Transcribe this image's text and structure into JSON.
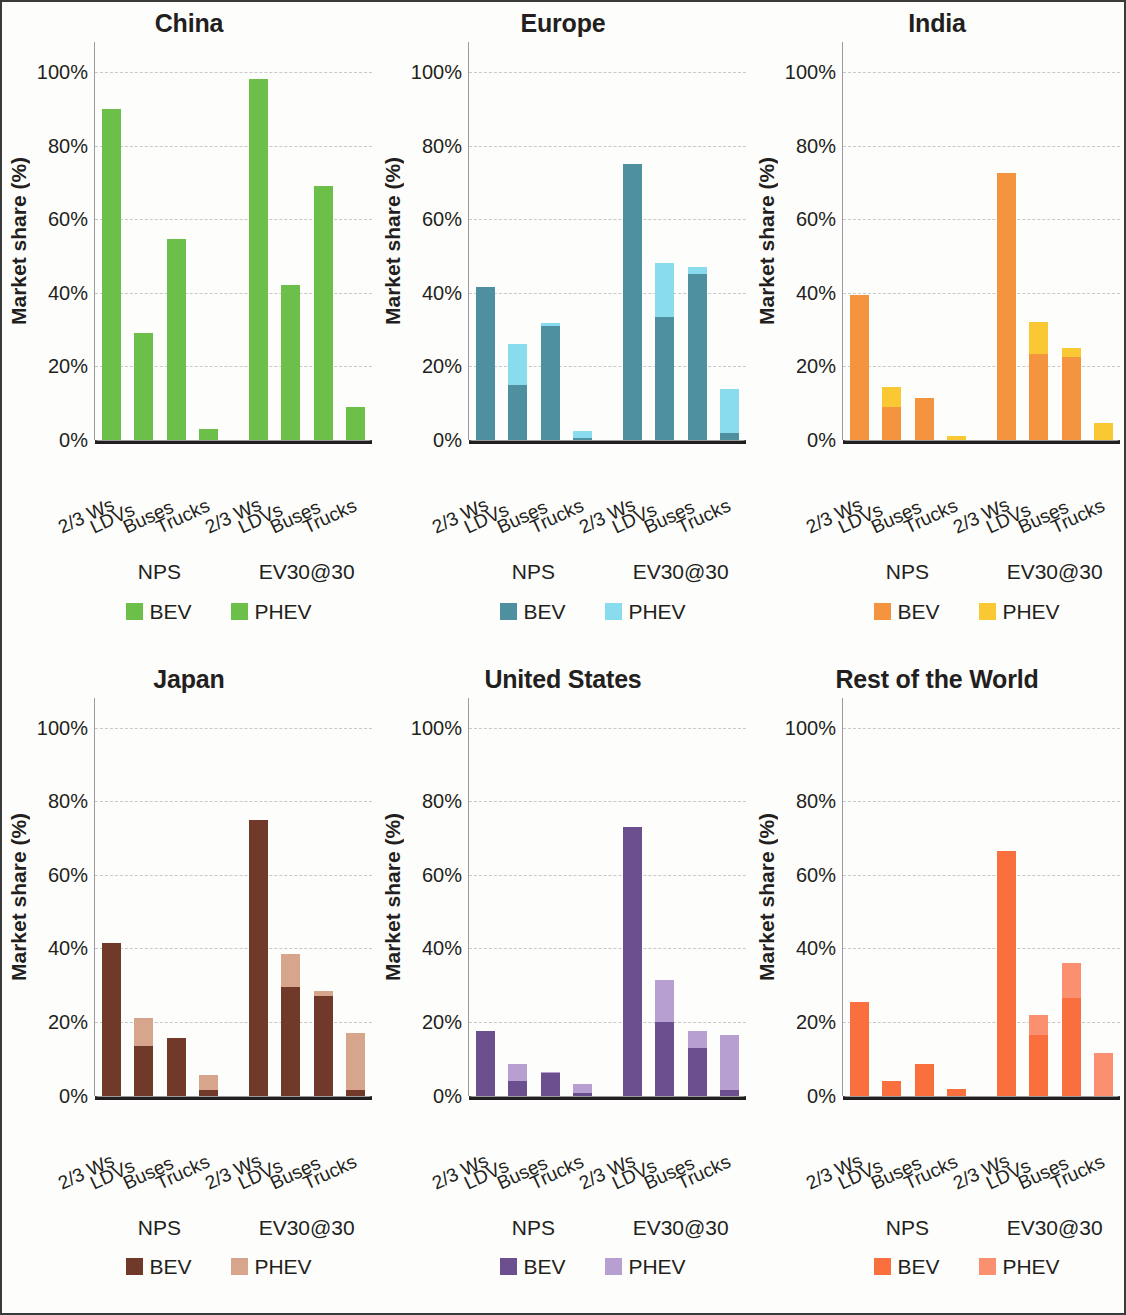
{
  "figure": {
    "ylabel": "Market share (%)",
    "yticks": [
      "0%",
      "20%",
      "40%",
      "60%",
      "80%",
      "100%"
    ],
    "ytick_values": [
      0,
      20,
      40,
      60,
      80,
      100
    ],
    "categories": [
      "2/3 Ws",
      "LDVs",
      "Buses",
      "Trucks"
    ],
    "scenarios": [
      "NPS",
      "EV30@30"
    ],
    "legend": [
      "BEV",
      "PHEV"
    ]
  },
  "chart_data": [
    {
      "type": "bar",
      "title": "China",
      "xlabel": "",
      "ylabel": "Market share (%)",
      "ylim": [
        0,
        100
      ],
      "grid": true,
      "legend_position": "bottom",
      "stacked": true,
      "categories": [
        "2/3 Ws",
        "LDVs",
        "Buses",
        "Trucks"
      ],
      "scenarios": [
        "NPS",
        "EV30@30"
      ],
      "colors": {
        "BEV": "#6cc04a",
        "PHEV": "#6cc04a"
      },
      "groups": [
        {
          "scenario": "NPS",
          "series": [
            {
              "name": "BEV",
              "values": [
                90,
                29,
                54.5,
                3
              ]
            },
            {
              "name": "PHEV",
              "values": [
                0,
                0,
                0,
                0
              ]
            }
          ]
        },
        {
          "scenario": "EV30@30",
          "series": [
            {
              "name": "BEV",
              "values": [
                98,
                42,
                69,
                9
              ]
            },
            {
              "name": "PHEV",
              "values": [
                0,
                0,
                0,
                0
              ]
            }
          ]
        }
      ]
    },
    {
      "type": "bar",
      "title": "Europe",
      "xlabel": "",
      "ylabel": "Market share (%)",
      "ylim": [
        0,
        100
      ],
      "grid": true,
      "legend_position": "bottom",
      "stacked": true,
      "categories": [
        "2/3 Ws",
        "LDVs",
        "Buses",
        "Trucks"
      ],
      "scenarios": [
        "NPS",
        "EV30@30"
      ],
      "colors": {
        "BEV": "#4e8fa0",
        "PHEV": "#88dcee"
      },
      "groups": [
        {
          "scenario": "NPS",
          "series": [
            {
              "name": "BEV",
              "values": [
                41.5,
                15,
                31,
                0.6
              ]
            },
            {
              "name": "PHEV",
              "values": [
                0,
                11,
                0.8,
                1.8
              ]
            }
          ]
        },
        {
          "scenario": "EV30@30",
          "series": [
            {
              "name": "BEV",
              "values": [
                75,
                33.5,
                45,
                1.8
              ]
            },
            {
              "name": "PHEV",
              "values": [
                0,
                14.5,
                2,
                12.2
              ]
            }
          ]
        }
      ]
    },
    {
      "type": "bar",
      "title": "India",
      "xlabel": "",
      "ylabel": "Market share (%)",
      "ylim": [
        0,
        100
      ],
      "grid": true,
      "legend_position": "bottom",
      "stacked": true,
      "categories": [
        "2/3 Ws",
        "LDVs",
        "Buses",
        "Trucks"
      ],
      "scenarios": [
        "NPS",
        "EV30@30"
      ],
      "colors": {
        "BEV": "#f5943f",
        "PHEV": "#fac832"
      },
      "groups": [
        {
          "scenario": "NPS",
          "series": [
            {
              "name": "BEV",
              "values": [
                39.5,
                9,
                11.5,
                0
              ]
            },
            {
              "name": "PHEV",
              "values": [
                0,
                5.5,
                0,
                1
              ]
            }
          ]
        },
        {
          "scenario": "EV30@30",
          "series": [
            {
              "name": "BEV",
              "values": [
                72.5,
                23.5,
                22.5,
                0
              ]
            },
            {
              "name": "PHEV",
              "values": [
                0,
                8.5,
                2.5,
                4.5
              ]
            }
          ]
        }
      ]
    },
    {
      "type": "bar",
      "title": "Japan",
      "xlabel": "",
      "ylabel": "Market share (%)",
      "ylim": [
        0,
        100
      ],
      "grid": true,
      "legend_position": "bottom",
      "stacked": true,
      "categories": [
        "2/3 Ws",
        "LDVs",
        "Buses",
        "Trucks"
      ],
      "scenarios": [
        "NPS",
        "EV30@30"
      ],
      "colors": {
        "BEV": "#71392a",
        "PHEV": "#d6a58c"
      },
      "groups": [
        {
          "scenario": "NPS",
          "series": [
            {
              "name": "BEV",
              "values": [
                41.5,
                13.5,
                15.5,
                1.5
              ]
            },
            {
              "name": "PHEV",
              "values": [
                0,
                7.5,
                0,
                4
              ]
            }
          ]
        },
        {
          "scenario": "EV30@30",
          "series": [
            {
              "name": "BEV",
              "values": [
                75,
                29.5,
                27,
                1.5
              ]
            },
            {
              "name": "PHEV",
              "values": [
                0,
                9,
                1.5,
                15.5
              ]
            }
          ]
        }
      ]
    },
    {
      "type": "bar",
      "title": "United States",
      "xlabel": "",
      "ylabel": "Market share (%)",
      "ylim": [
        0,
        100
      ],
      "grid": true,
      "legend_position": "bottom",
      "stacked": true,
      "categories": [
        "2/3 Ws",
        "LDVs",
        "Buses",
        "Trucks"
      ],
      "scenarios": [
        "NPS",
        "EV30@30"
      ],
      "colors": {
        "BEV": "#6b4f8f",
        "PHEV": "#b79fd1"
      },
      "groups": [
        {
          "scenario": "NPS",
          "series": [
            {
              "name": "BEV",
              "values": [
                17.5,
                4,
                6,
                0.8
              ]
            },
            {
              "name": "PHEV",
              "values": [
                0,
                4.5,
                0.5,
                2.2
              ]
            }
          ]
        },
        {
          "scenario": "EV30@30",
          "series": [
            {
              "name": "BEV",
              "values": [
                73,
                20,
                13,
                1.5
              ]
            },
            {
              "name": "PHEV",
              "values": [
                0,
                11.5,
                4.5,
                15
              ]
            }
          ]
        }
      ]
    },
    {
      "type": "bar",
      "title": "Rest of the World",
      "xlabel": "",
      "ylabel": "Market share (%)",
      "ylim": [
        0,
        100
      ],
      "grid": true,
      "legend_position": "bottom",
      "stacked": true,
      "categories": [
        "2/3 Ws",
        "LDVs",
        "Buses",
        "Trucks"
      ],
      "scenarios": [
        "NPS",
        "EV30@30"
      ],
      "colors": {
        "BEV": "#f9703e",
        "PHEV": "#fb9070"
      },
      "groups": [
        {
          "scenario": "NPS",
          "series": [
            {
              "name": "BEV",
              "values": [
                25.5,
                4,
                8.5,
                1.8
              ]
            },
            {
              "name": "PHEV",
              "values": [
                0,
                0,
                0,
                0
              ]
            }
          ]
        },
        {
          "scenario": "EV30@30",
          "series": [
            {
              "name": "BEV",
              "values": [
                66.5,
                16.5,
                26.5,
                0
              ]
            },
            {
              "name": "PHEV",
              "values": [
                0,
                5.5,
                9.5,
                11.5
              ]
            }
          ]
        }
      ]
    }
  ]
}
